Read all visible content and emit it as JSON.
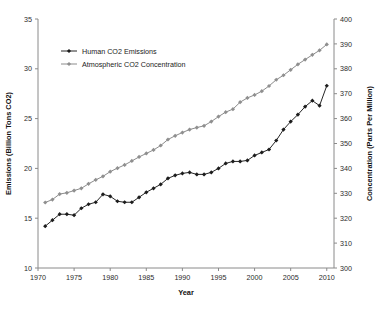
{
  "chart_data": {
    "type": "line",
    "title": "",
    "xlabel": "Year",
    "ylabel": "Emissions (Billion Tons CO2)",
    "y2label": "Concentration (Parts Per Million)",
    "grid": false,
    "legend_position": "upper-left-inside",
    "xlim": [
      1970,
      2011
    ],
    "xticks": [
      1970,
      1975,
      1980,
      1985,
      1990,
      1995,
      2000,
      2005,
      2010
    ],
    "xtick_labels": [
      "1970",
      "1975",
      "1980",
      "1985",
      "1990",
      "1995",
      "2000",
      "2005",
      "2010"
    ],
    "ylim": [
      10,
      35
    ],
    "yticks": [
      10,
      15,
      20,
      25,
      30,
      35
    ],
    "ytick_labels": [
      "10",
      "15",
      "20",
      "25",
      "30",
      "35"
    ],
    "y2lim": [
      300,
      400
    ],
    "y2ticks": [
      300,
      310,
      320,
      330,
      340,
      350,
      360,
      370,
      380,
      390,
      400
    ],
    "y2tick_labels": [
      "300",
      "310",
      "320",
      "330",
      "340",
      "350",
      "360",
      "370",
      "380",
      "390",
      "400"
    ],
    "x": [
      1971,
      1972,
      1973,
      1974,
      1975,
      1976,
      1977,
      1978,
      1979,
      1980,
      1981,
      1982,
      1983,
      1984,
      1985,
      1986,
      1987,
      1988,
      1989,
      1990,
      1991,
      1992,
      1993,
      1994,
      1995,
      1996,
      1997,
      1998,
      1999,
      2000,
      2001,
      2002,
      2003,
      2004,
      2005,
      2006,
      2007,
      2008,
      2009,
      2010
    ],
    "series": [
      {
        "name": "Human CO2 Emissions",
        "axis": "left",
        "color": "#262626",
        "marker": "diamond",
        "unit": "Billion Tons CO2",
        "values": [
          14.2,
          14.8,
          15.4,
          15.4,
          15.3,
          16.0,
          16.4,
          16.6,
          17.4,
          17.2,
          16.7,
          16.6,
          16.6,
          17.1,
          17.6,
          18.0,
          18.4,
          19.0,
          19.3,
          19.5,
          19.6,
          19.4,
          19.4,
          19.6,
          20.0,
          20.5,
          20.7,
          20.7,
          20.8,
          21.3,
          21.6,
          21.9,
          22.8,
          23.9,
          24.7,
          25.4,
          26.2,
          26.8,
          26.3,
          28.3
        ],
        "annotations": [
          {
            "x": 1979,
            "note": "local peak before early-1980s decline"
          },
          {
            "x": 2009,
            "note": "dip during global recession"
          },
          {
            "x": 2010,
            "note": "rebound to series maximum"
          }
        ]
      },
      {
        "name": "Atmospheric CO2 Concentration",
        "axis": "right",
        "color": "#8c8c8c",
        "marker": "diamond",
        "unit": "Parts Per Million",
        "values": [
          326.3,
          327.5,
          329.7,
          330.2,
          331.1,
          332.0,
          333.8,
          335.4,
          336.8,
          338.7,
          340.1,
          341.4,
          343.0,
          344.6,
          346.0,
          347.4,
          349.2,
          351.6,
          353.1,
          354.4,
          355.6,
          356.4,
          357.1,
          358.8,
          360.8,
          362.6,
          363.8,
          366.6,
          368.3,
          369.5,
          371.0,
          373.1,
          375.6,
          377.4,
          379.6,
          381.8,
          383.7,
          385.6,
          387.4,
          389.8
        ]
      }
    ],
    "legend_items": [
      {
        "label": "Human CO2 Emissions",
        "color": "#262626",
        "marker": "diamond"
      },
      {
        "label": "Atmospheric CO2 Concentration",
        "color": "#8c8c8c",
        "marker": "diamond"
      }
    ]
  }
}
